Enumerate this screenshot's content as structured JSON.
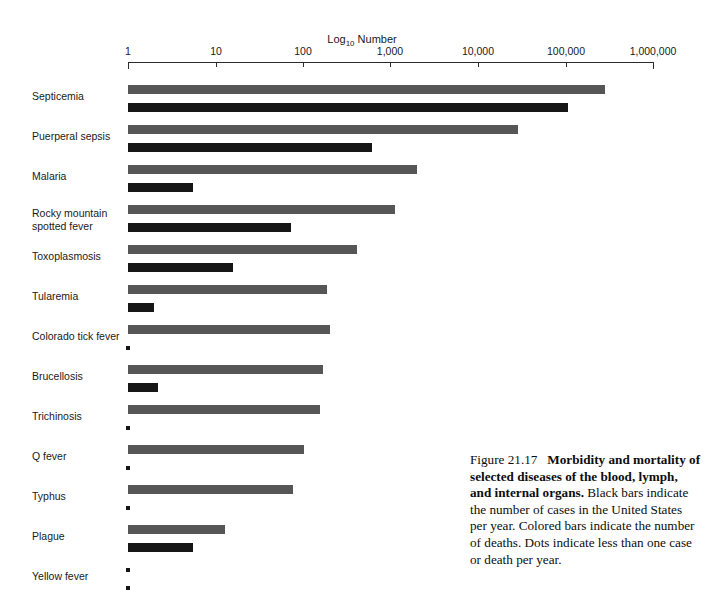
{
  "figure": {
    "caption_number": "Figure 21.17",
    "caption_bold": "Morbidity and mortality of selected diseases of the blood, lymph, and internal organs.",
    "caption_rest": " Black bars indicate the number of cases in the United States per year. Colored bars indicate the number of deaths. Dots indicate less than one case or death per year."
  },
  "chart_data": {
    "type": "bar",
    "orientation": "horizontal",
    "title": "",
    "xlabel": "Log10 Number",
    "ylabel": "",
    "scale": "log10",
    "xlim": [
      1,
      1000000
    ],
    "grid": false,
    "legend_position": "none",
    "tick_labels": [
      "1",
      "10",
      "100",
      "1,000",
      "10,000",
      "100,000",
      "1,000,000"
    ],
    "tick_values": [
      1,
      10,
      100,
      1000,
      10000,
      100000,
      1000000
    ],
    "categories": [
      "Septicemia",
      "Puerperal sepsis",
      "Malaria",
      "Rocky mountain\nspotted fever",
      "Toxoplasmosis",
      "Tularemia",
      "Colorado tick fever",
      "Brucellosis",
      "Trichinosis",
      "Q fever",
      "Typhus",
      "Plague",
      "Yellow fever"
    ],
    "series": [
      {
        "name": "Cases (black bars)",
        "color": "#161616",
        "values": [
          107000,
          615,
          5.5,
          73,
          16,
          2.0,
          0.5,
          2.2,
          0.5,
          0.5,
          0.5,
          5.5,
          0.5
        ],
        "below_one": [
          false,
          false,
          false,
          false,
          false,
          false,
          true,
          false,
          true,
          true,
          true,
          false,
          true
        ]
      },
      {
        "name": "Deaths (colored bars)",
        "color": "#565656",
        "values": [
          280000,
          29000,
          2000,
          1120,
          415,
          187,
          203,
          170,
          156,
          103,
          77,
          13,
          0.5
        ],
        "below_one": [
          false,
          false,
          false,
          false,
          false,
          false,
          false,
          false,
          false,
          false,
          false,
          false,
          true
        ]
      }
    ],
    "notes": {
      "colored_bar_meaning": "number of deaths",
      "black_bar_meaning": "number of cases",
      "dot_meaning": "less than one case or death per year"
    }
  }
}
